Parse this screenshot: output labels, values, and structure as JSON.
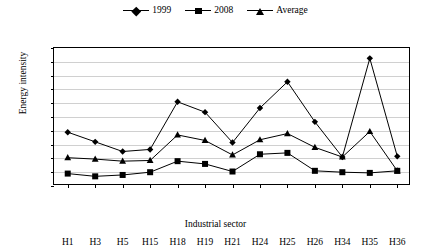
{
  "legend": {
    "position": "top-center",
    "items": [
      {
        "label": "1999",
        "marker": "diamond-marker-icon"
      },
      {
        "label": "2008",
        "marker": "square-marker-icon"
      },
      {
        "label": "Average",
        "marker": "triangle-marker-icon"
      }
    ]
  },
  "axes": {
    "ylabel": "Energy intensity",
    "xlabel": "Industrial sector",
    "yticks": [
      0,
      2,
      4,
      6,
      8,
      10,
      12,
      14,
      16,
      18,
      20
    ]
  },
  "chart_data": {
    "type": "line",
    "title": "",
    "xlabel": "Industrial sector",
    "ylabel": "Energy intensity",
    "ylim": [
      0,
      20
    ],
    "grid": true,
    "legend_position": "top-center",
    "categories": [
      "H1",
      "H3",
      "H5",
      "H15",
      "H18",
      "H19",
      "H21",
      "H24",
      "H25",
      "H26",
      "H34",
      "H35",
      "H36"
    ],
    "series": [
      {
        "name": "1999",
        "marker": "diamond",
        "values": [
          7.8,
          6.4,
          5.0,
          5.3,
          12.2,
          10.7,
          6.3,
          11.3,
          15.1,
          9.3,
          4.2,
          18.5,
          4.3
        ]
      },
      {
        "name": "2008",
        "marker": "square",
        "values": [
          1.8,
          1.4,
          1.6,
          2.0,
          3.6,
          3.2,
          2.1,
          4.6,
          4.8,
          2.2,
          2.0,
          1.9,
          2.2
        ]
      },
      {
        "name": "Average",
        "marker": "triangle",
        "values": [
          4.1,
          3.9,
          3.6,
          3.7,
          7.4,
          6.6,
          4.5,
          6.7,
          7.6,
          5.6,
          4.2,
          7.9,
          2.2
        ]
      }
    ]
  }
}
